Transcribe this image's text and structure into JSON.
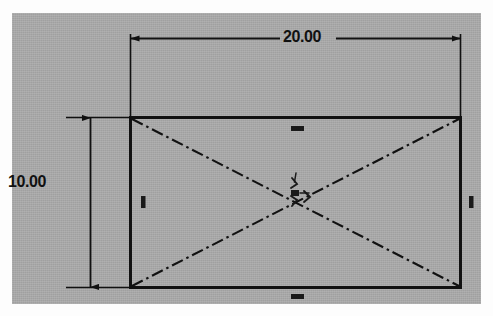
{
  "drawing": {
    "title": "Rectangle sketch with dimensions",
    "canvas_color": "#a9a9a9",
    "line_color": "#111111",
    "page_color": "#fdfdfd"
  },
  "dimensions": [
    {
      "id": "width",
      "value": "20.00",
      "orientation": "horizontal",
      "label": "overall width dimension"
    },
    {
      "id": "height",
      "value": "10.00",
      "orientation": "vertical",
      "label": "overall height dimension"
    }
  ],
  "geometry": {
    "rectangle": {
      "name": "rectangle-profile",
      "x1": 130,
      "y1": 117,
      "x2": 461,
      "y2": 288
    },
    "diagonals": [
      {
        "name": "diagonal-construction-line-1",
        "x1": 130,
        "y1": 117,
        "x2": 461,
        "y2": 288
      },
      {
        "name": "diagonal-construction-line-2",
        "x1": 130,
        "y1": 288,
        "x2": 461,
        "y2": 117
      }
    ]
  },
  "relations": [
    {
      "id": "top",
      "symbol": "horizontal",
      "glyph": "—",
      "x": 295,
      "y": 128
    },
    {
      "id": "bottom",
      "symbol": "horizontal",
      "glyph": "—",
      "x": 295,
      "y": 296
    },
    {
      "id": "left",
      "symbol": "vertical",
      "glyph": "|",
      "x": 143,
      "y": 202
    },
    {
      "id": "right",
      "symbol": "vertical",
      "glyph": "|",
      "x": 471,
      "y": 202
    },
    {
      "id": "center",
      "symbol": "midpoint-cluster",
      "glyph": "≻",
      "x": 300,
      "y": 198
    }
  ]
}
